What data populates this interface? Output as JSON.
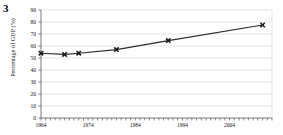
{
  "figure": {
    "number": "3"
  },
  "chart_data": {
    "type": "line",
    "title": "",
    "xlabel": "",
    "ylabel": "Percentage of GDP (%)",
    "xlim": [
      1964,
      2013
    ],
    "ylim": [
      0,
      90
    ],
    "ytick_step": 10,
    "xtick_step": 1,
    "grid": true,
    "grid_axis": "y",
    "legend": "none",
    "marker": "x-cross",
    "line_color": "#2b2b2b",
    "marker_color": "#1a1a1a",
    "grid_color": "#d9d9d9",
    "axis_color": "#555555",
    "x": [
      1964,
      1969,
      1972,
      1980,
      1991,
      2011
    ],
    "values": [
      54,
      53,
      54,
      57,
      64.5,
      77.5
    ],
    "yticks": [
      0,
      10,
      20,
      30,
      40,
      50,
      60,
      70,
      80,
      90
    ],
    "ytick_labels": [
      "0",
      "10",
      "20",
      "30",
      "40",
      "50",
      "60",
      "70",
      "80",
      "90"
    ],
    "xticks": [
      1964,
      1974,
      1984,
      1994,
      2004
    ],
    "xtick_labels": [
      "1964",
      "1974",
      "1984",
      "1994",
      "2004"
    ]
  }
}
